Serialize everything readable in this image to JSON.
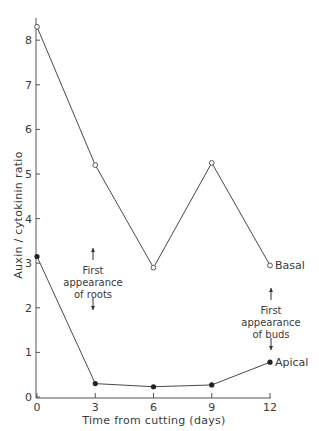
{
  "chart_data": {
    "type": "line",
    "title": "",
    "xlabel": "Time from cutting (days)",
    "ylabel": "Auxin / cytokinin ratio",
    "x": [
      0,
      3,
      6,
      9,
      12
    ],
    "xticks": [
      "0",
      "3",
      "6",
      "9",
      "12"
    ],
    "yticks": [
      "0",
      "1",
      "2",
      "3",
      "4",
      "5",
      "6",
      "7",
      "8"
    ],
    "xlim": [
      0,
      12
    ],
    "ylim": [
      0,
      8.5
    ],
    "grid": false,
    "legend_position": "inline at right end of each line",
    "series": [
      {
        "name": "Basal",
        "marker": "open-circle",
        "values": [
          8.3,
          5.2,
          2.9,
          5.25,
          2.95
        ]
      },
      {
        "name": "Apical",
        "marker": "filled-circle",
        "values": [
          3.15,
          0.3,
          0.23,
          0.27,
          0.78
        ]
      }
    ],
    "annotations": [
      {
        "text_lines": [
          "First",
          "appearance",
          "of roots"
        ],
        "x": 3,
        "arrows": "up-and-down"
      },
      {
        "text_lines": [
          "First",
          "appearance",
          "of buds"
        ],
        "x": 12,
        "arrows": "up-and-down"
      }
    ]
  },
  "colors": {
    "line": "#4a4a4a",
    "text": "#3a3a3a",
    "background": "#ffffff"
  }
}
